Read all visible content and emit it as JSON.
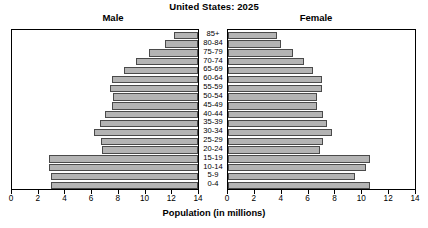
{
  "header": {
    "title": "United States: 2025",
    "male_label": "Male",
    "female_label": "Female"
  },
  "axis": {
    "title": "Population (in millions)",
    "male_ticks": [
      "14",
      "12",
      "10",
      "8",
      "6",
      "4",
      "2",
      "0"
    ],
    "female_ticks": [
      "0",
      "2",
      "4",
      "6",
      "8",
      "10",
      "12",
      "14"
    ]
  },
  "chart_data": {
    "type": "bar",
    "subtype": "population-pyramid",
    "title": "United States: 2025",
    "xlabel": "Population (in millions)",
    "ylabel": "",
    "xlim": [
      0,
      14
    ],
    "xtick_step": 2,
    "grid": false,
    "bar_color": "#b4b4b4",
    "bar_edge_color": "#4a4a4a",
    "categories": [
      "85+",
      "80-84",
      "75-79",
      "70-74",
      "65-69",
      "60-64",
      "55-59",
      "50-54",
      "45-49",
      "40-44",
      "35-39",
      "30-34",
      "25-29",
      "20-24",
      "15-19",
      "10-14",
      "5-9",
      "0-4"
    ],
    "series": [
      {
        "name": "Male",
        "side": "left",
        "values": [
          1.8,
          2.5,
          3.7,
          4.7,
          5.6,
          6.5,
          6.6,
          6.4,
          6.5,
          7.0,
          7.4,
          7.8,
          7.3,
          7.2,
          11.2,
          11.2,
          11.1,
          11.1
        ]
      },
      {
        "name": "Female",
        "side": "right",
        "values": [
          3.7,
          4.0,
          4.9,
          5.7,
          6.4,
          7.0,
          7.0,
          6.7,
          6.7,
          7.1,
          7.4,
          7.8,
          7.1,
          6.9,
          10.6,
          10.3,
          9.5,
          10.6
        ]
      }
    ]
  }
}
